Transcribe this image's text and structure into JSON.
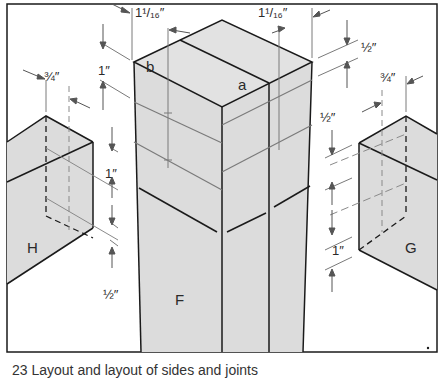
{
  "figure": {
    "caption": "23 Layout and layout of sides and joints"
  },
  "colors": {
    "fill": "#dcdcdc",
    "outline": "#1a1a1a",
    "dimension_line": "#7a7a7a",
    "background": "#ffffff"
  },
  "parts": {
    "main_block": {
      "label": "F",
      "top_labels": {
        "left": "b",
        "right": "a"
      }
    },
    "left_block": {
      "label": "H"
    },
    "right_block": {
      "label": "G"
    }
  },
  "dimensions": {
    "top_left_width": "1¹/₁₆″",
    "top_right_width": "1¹/₁₆″",
    "right_top_offset": "½″",
    "left_block_width": "¾″",
    "left_upper_height": "1″",
    "left_mid_height": "1″",
    "left_bottom_offset": "½″",
    "right_block_width": "¾″",
    "right_mid_offset": "½″",
    "right_lower_height": "1″"
  }
}
